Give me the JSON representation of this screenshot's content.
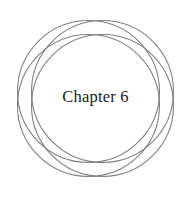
{
  "page": {
    "background_color": "#ffffff",
    "width": 191,
    "height": 197
  },
  "chapter": {
    "label": "Chapter 6",
    "word": "Chapter",
    "number": "6",
    "text_color": "#1a1a1a"
  },
  "ornament": {
    "name": "rosette-circles",
    "stroke_color": "#808080",
    "stroke_width": 1.1,
    "fill": "none",
    "circle_count": 4,
    "center": {
      "x": 95.5,
      "y": 98.5
    },
    "radius": 71,
    "circles": [
      {
        "cx": 88.5,
        "cy": 91.5,
        "r": 71
      },
      {
        "cx": 102.5,
        "cy": 91.5,
        "r": 71
      },
      {
        "cx": 88.5,
        "cy": 105.5,
        "r": 71
      },
      {
        "cx": 102.5,
        "cy": 105.5,
        "r": 71
      }
    ]
  }
}
